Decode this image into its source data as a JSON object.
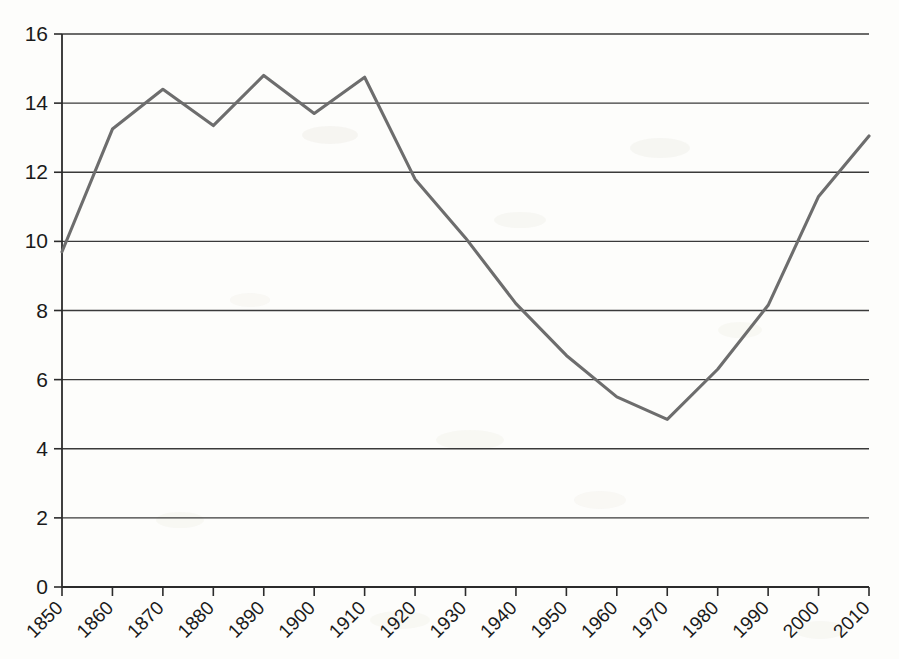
{
  "chart_data": {
    "type": "line",
    "title": "",
    "subtitle": "",
    "xlabel": "",
    "ylabel": "",
    "x": [
      1850,
      1860,
      1870,
      1880,
      1890,
      1900,
      1910,
      1920,
      1930,
      1940,
      1950,
      1960,
      1970,
      1980,
      1990,
      2000,
      2010
    ],
    "categories": [
      "1850",
      "1860",
      "1870",
      "1880",
      "1890",
      "1900",
      "1910",
      "1920",
      "1930",
      "1940",
      "1950",
      "1960",
      "1970",
      "1980",
      "1990",
      "2000",
      "2010"
    ],
    "values": [
      9.7,
      13.25,
      14.4,
      13.35,
      14.8,
      13.7,
      14.75,
      11.8,
      10.1,
      8.2,
      6.7,
      5.5,
      4.85,
      6.3,
      8.15,
      11.3,
      13.05
    ],
    "series": [
      {
        "name": "series-1",
        "color": "#6d6d6d",
        "values": [
          9.7,
          13.25,
          14.4,
          13.35,
          14.8,
          13.7,
          14.75,
          11.8,
          10.1,
          8.2,
          6.7,
          5.5,
          4.85,
          6.3,
          8.15,
          11.3,
          13.05
        ]
      }
    ],
    "xlim": [
      1850,
      2010
    ],
    "ylim": [
      0,
      16
    ],
    "y_ticks": [
      0,
      2,
      4,
      6,
      8,
      10,
      12,
      14,
      16
    ],
    "y_tick_labels": [
      "0",
      "2",
      "4",
      "6",
      "8",
      "10",
      "12",
      "14",
      "16"
    ],
    "x_ticks": [
      1850,
      1860,
      1870,
      1880,
      1890,
      1900,
      1910,
      1920,
      1930,
      1940,
      1950,
      1960,
      1970,
      1980,
      1990,
      2000,
      2010
    ],
    "x_tick_labels": [
      "1850",
      "1860",
      "1870",
      "1880",
      "1890",
      "1900",
      "1910",
      "1920",
      "1930",
      "1940",
      "1950",
      "1960",
      "1970",
      "1980",
      "1990",
      "2000",
      "2010"
    ],
    "x_tick_label_rotation": -45,
    "grid": {
      "horizontal": true,
      "vertical": false,
      "color": "#3a3a3a"
    },
    "legend": {
      "visible": false,
      "position": "none",
      "entries": []
    },
    "markers": false,
    "annotations": [],
    "background_color": "#fdfdfb",
    "axis_color": "#2b2b2b"
  }
}
